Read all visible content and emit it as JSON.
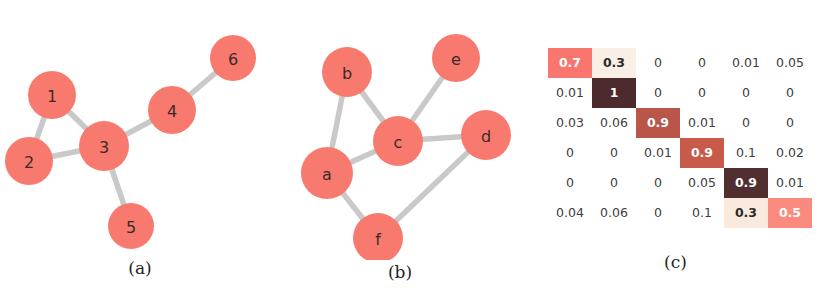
{
  "figure": {
    "background_color": "#ffffff",
    "node_color": "#f87a6f",
    "node_label_color": "#3a2a2a",
    "edge_color": "#c7c7c7"
  },
  "panels": [
    {
      "id": "a",
      "caption": "(a)",
      "type": "graph",
      "nodes": [
        {
          "label": "1",
          "x": 52,
          "y": 95,
          "r": 24
        },
        {
          "label": "2",
          "x": 29,
          "y": 161,
          "r": 24
        },
        {
          "label": "3",
          "x": 104,
          "y": 146,
          "r": 25
        },
        {
          "label": "4",
          "x": 172,
          "y": 110,
          "r": 24
        },
        {
          "label": "5",
          "x": 131,
          "y": 226,
          "r": 23
        },
        {
          "label": "6",
          "x": 233,
          "y": 58,
          "r": 23
        }
      ],
      "edges": [
        {
          "from": "1",
          "to": "2"
        },
        {
          "from": "1",
          "to": "3"
        },
        {
          "from": "2",
          "to": "3"
        },
        {
          "from": "3",
          "to": "4"
        },
        {
          "from": "3",
          "to": "5"
        },
        {
          "from": "4",
          "to": "6"
        }
      ]
    },
    {
      "id": "b",
      "caption": "(b)",
      "type": "graph",
      "nodes": [
        {
          "label": "b",
          "x": 67,
          "y": 72,
          "r": 25
        },
        {
          "label": "e",
          "x": 176,
          "y": 58,
          "r": 24
        },
        {
          "label": "c",
          "x": 118,
          "y": 141,
          "r": 25
        },
        {
          "label": "d",
          "x": 206,
          "y": 135,
          "r": 25
        },
        {
          "label": "a",
          "x": 47,
          "y": 173,
          "r": 26
        },
        {
          "label": "f",
          "x": 98,
          "y": 238,
          "r": 25
        }
      ],
      "edges": [
        {
          "from": "a",
          "to": "b"
        },
        {
          "from": "b",
          "to": "c"
        },
        {
          "from": "a",
          "to": "c"
        },
        {
          "from": "c",
          "to": "e"
        },
        {
          "from": "c",
          "to": "d"
        },
        {
          "from": "a",
          "to": "f"
        },
        {
          "from": "f",
          "to": "d"
        }
      ]
    },
    {
      "id": "c",
      "caption": "(c)",
      "type": "matrix"
    }
  ],
  "chart_data": {
    "type": "heatmap",
    "title": "",
    "xlabel": "",
    "ylabel": "",
    "rows": 6,
    "cols": 6,
    "values": [
      [
        "0.7",
        "0.3",
        "0",
        "0",
        "0.01",
        "0.05"
      ],
      [
        "0.01",
        "1",
        "0",
        "0",
        "0",
        "0"
      ],
      [
        "0.03",
        "0.06",
        "0.9",
        "0.01",
        "0",
        "0"
      ],
      [
        "0",
        "0",
        "0.01",
        "0.9",
        "0.1",
        "0.02"
      ],
      [
        "0",
        "0",
        "0",
        "0.05",
        "0.9",
        "0.01"
      ],
      [
        "0.04",
        "0.06",
        "0",
        "0.1",
        "0.3",
        "0.5"
      ]
    ],
    "numeric_values": [
      [
        0.7,
        0.3,
        0,
        0,
        0.01,
        0.05
      ],
      [
        0.01,
        1,
        0,
        0,
        0,
        0
      ],
      [
        0.03,
        0.06,
        0.9,
        0.01,
        0,
        0
      ],
      [
        0,
        0,
        0.01,
        0.9,
        0.1,
        0.02
      ],
      [
        0,
        0,
        0,
        0.05,
        0.9,
        0.01
      ],
      [
        0.04,
        0.06,
        0,
        0.1,
        0.3,
        0.5
      ]
    ],
    "cell_styles": [
      [
        {
          "bg": "#f8766d",
          "fg": "#ffffff"
        },
        {
          "bg": "#faefe4",
          "fg": "#2b2b2b"
        },
        {
          "bg": "#ffffff",
          "fg": "#3d3d3d"
        },
        {
          "bg": "#ffffff",
          "fg": "#3d3d3d"
        },
        {
          "bg": "#ffffff",
          "fg": "#3d3d3d"
        },
        {
          "bg": "#ffffff",
          "fg": "#3d3d3d"
        }
      ],
      [
        {
          "bg": "#ffffff",
          "fg": "#3d3d3d"
        },
        {
          "bg": "#4d2a2c",
          "fg": "#ffffff"
        },
        {
          "bg": "#ffffff",
          "fg": "#3d3d3d"
        },
        {
          "bg": "#ffffff",
          "fg": "#3d3d3d"
        },
        {
          "bg": "#ffffff",
          "fg": "#3d3d3d"
        },
        {
          "bg": "#ffffff",
          "fg": "#3d3d3d"
        }
      ],
      [
        {
          "bg": "#ffffff",
          "fg": "#3d3d3d"
        },
        {
          "bg": "#ffffff",
          "fg": "#3d3d3d"
        },
        {
          "bg": "#b9564a",
          "fg": "#ffffff"
        },
        {
          "bg": "#ffffff",
          "fg": "#3d3d3d"
        },
        {
          "bg": "#ffffff",
          "fg": "#3d3d3d"
        },
        {
          "bg": "#ffffff",
          "fg": "#3d3d3d"
        }
      ],
      [
        {
          "bg": "#ffffff",
          "fg": "#3d3d3d"
        },
        {
          "bg": "#ffffff",
          "fg": "#3d3d3d"
        },
        {
          "bg": "#ffffff",
          "fg": "#3d3d3d"
        },
        {
          "bg": "#c85a4a",
          "fg": "#ffffff"
        },
        {
          "bg": "#ffffff",
          "fg": "#3d3d3d"
        },
        {
          "bg": "#ffffff",
          "fg": "#3d3d3d"
        }
      ],
      [
        {
          "bg": "#ffffff",
          "fg": "#3d3d3d"
        },
        {
          "bg": "#ffffff",
          "fg": "#3d3d3d"
        },
        {
          "bg": "#ffffff",
          "fg": "#3d3d3d"
        },
        {
          "bg": "#ffffff",
          "fg": "#3d3d3d"
        },
        {
          "bg": "#512e30",
          "fg": "#ffffff"
        },
        {
          "bg": "#ffffff",
          "fg": "#3d3d3d"
        }
      ],
      [
        {
          "bg": "#ffffff",
          "fg": "#3d3d3d"
        },
        {
          "bg": "#ffffff",
          "fg": "#3d3d3d"
        },
        {
          "bg": "#ffffff",
          "fg": "#3d3d3d"
        },
        {
          "bg": "#ffffff",
          "fg": "#3d3d3d"
        },
        {
          "bg": "#faeadd",
          "fg": "#2b2b2b"
        },
        {
          "bg": "#fa8a7e",
          "fg": "#ffffff"
        }
      ]
    ],
    "legend": [],
    "grid": false
  }
}
